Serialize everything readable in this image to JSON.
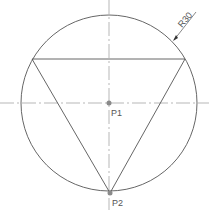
{
  "diagram": {
    "circle_label": "R30",
    "center_label": "P1",
    "vertex_label": "P2",
    "colors": {
      "stroke": "#555555",
      "centerline": "#9a9a9a",
      "point": "#8a8a8a"
    }
  }
}
